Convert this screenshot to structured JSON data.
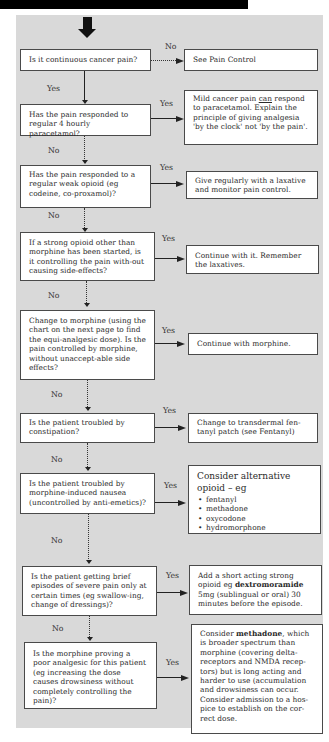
{
  "flowchart": {
    "labels": {
      "yes": "Yes",
      "no": "No"
    },
    "questions": [
      {
        "text": "Is it continuous cancer pain?"
      },
      {
        "text": "Has the pain responded to regular 4 hourly paracetamol?"
      },
      {
        "text": "Has the pain responded to a regular weak opioid (eg codeine, co-proxamol)?"
      },
      {
        "text": "If a strong opioid other than morphine has been started, is it controlling the pain with-out causing side-effects?"
      },
      {
        "text": "Change to morphine (using the chart on the next page to find the equi-analgesic dose). Is the pain controlled by morphine, without unaccept-able side effects?"
      },
      {
        "text": "Is the patient troubled by constipation?"
      },
      {
        "text": "Is the patient troubled by morphine-induced nausea (uncontrolled by anti-emetics)?"
      },
      {
        "text": "Is the patient getting brief episodes of severe pain only at certain times (eg swallow-ing, change of dressings)?"
      },
      {
        "text": "Is the morphine proving a poor analgesic for this patient (eg increasing the dose causes drowsiness without completely controlling the pain)?"
      }
    ],
    "outcomes": [
      {
        "text": "See Pain Control"
      },
      {
        "pre": "Mild cancer pain ",
        "underlined": "can",
        "post": " respond to paracetamol. Explain the principle of giving analgesia 'by the clock' not 'by the pain'."
      },
      {
        "text": "Give regularly with a laxative and monitor pain control."
      },
      {
        "text": "Continue with it. Remember the laxatives."
      },
      {
        "text": "Continue with morphine."
      },
      {
        "text": "Change to transdermal fen-tanyl patch (see Fentanyl)"
      },
      {
        "title": "Consider alternative opioid – eg",
        "items": [
          "fentanyl",
          "methadone",
          "oxycodone",
          "hydromorphone"
        ]
      },
      {
        "pre": "Add a short acting strong opioid eg ",
        "bold": "dextromoramide",
        "post": " 5mg (sublingual or oral) 30 minutes before the episode."
      },
      {
        "pre": "Consider ",
        "bold": "methadone",
        "post": ", which is broader spectrum than morphine (covering delta-receptors and NMDA recep-tors) but is long acting and harder to use (accumulation and drowsiness can occur. Consider admission to a hos-pice to establish on the cor-rect dose."
      }
    ]
  }
}
